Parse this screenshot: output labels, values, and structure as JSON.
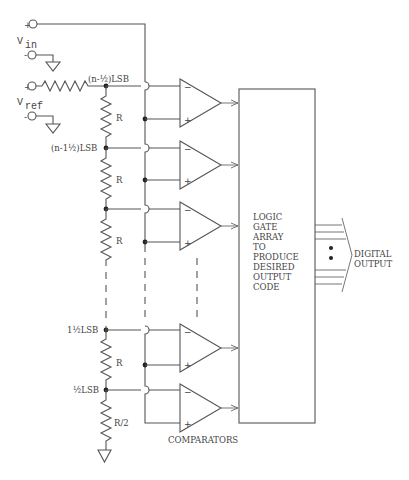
{
  "diagram": {
    "inputs": {
      "vin_label": "V",
      "vin_sub": "in",
      "vref_label": "V",
      "vref_sub": "ref",
      "plus": "+",
      "minus": "-"
    },
    "ladder": {
      "node_labels": [
        "(n-½)LSB",
        "(n-1½)LSB",
        "1½LSB",
        "½LSB"
      ],
      "resistors": [
        "R",
        "R",
        "R",
        "R",
        "R/2"
      ]
    },
    "comparators": {
      "count_shown": 5,
      "label": "COMPARATORS",
      "minus_sign": "−",
      "plus_sign": "+"
    },
    "logic_block": {
      "lines": [
        "LOGIC",
        "GATE",
        "ARRAY",
        "TO",
        "PRODUCE",
        "DESIRED",
        "OUTPUT",
        "CODE"
      ]
    },
    "output": {
      "lines": [
        "DIGITAL",
        "OUTPUT"
      ]
    },
    "colors": {
      "line": "#555555",
      "text": "#444444",
      "background": "#ffffff"
    }
  }
}
